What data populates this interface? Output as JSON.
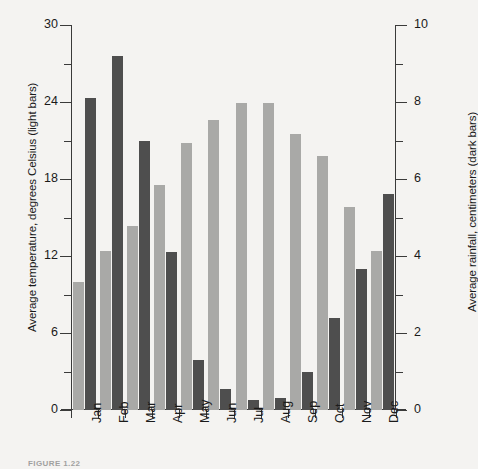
{
  "chart_data": {
    "type": "bar",
    "title": "",
    "subtitle": "",
    "categories": [
      "Jan",
      "Feb",
      "Mar",
      "Apr",
      "May",
      "Jun",
      "Jul",
      "Aug",
      "Sep",
      "Oct",
      "Nov",
      "Dec"
    ],
    "series": [
      {
        "name": "Average temperature",
        "unit": "degrees Celsius",
        "axis": "left",
        "color": "#a9a9a7",
        "style": "light bars",
        "values": [
          10.0,
          12.4,
          14.3,
          17.5,
          20.8,
          22.6,
          23.9,
          23.9,
          21.5,
          19.8,
          15.8,
          12.4
        ]
      },
      {
        "name": "Average rainfall",
        "unit": "centimeters",
        "axis": "right",
        "color": "#4e4e4e",
        "style": "dark bars",
        "values": [
          8.1,
          9.2,
          7.0,
          4.1,
          1.3,
          0.55,
          0.25,
          0.3,
          1.0,
          2.4,
          3.65,
          5.6
        ]
      }
    ],
    "xlabel": "",
    "ylabel_left": "Average temperature, degrees Celsius (light bars)",
    "ylabel_right": "Average rainfall, centimeters (dark bars)",
    "ylim_left": [
      0,
      30
    ],
    "ylim_right": [
      0,
      10
    ],
    "yticks_left": [
      0,
      6,
      12,
      18,
      24,
      30
    ],
    "yticks_left_minor": [
      3,
      9,
      15,
      21,
      27
    ],
    "yticks_right": [
      0,
      2,
      4,
      6,
      8,
      10
    ],
    "yticks_right_minor": [
      1,
      3,
      5,
      7,
      9
    ],
    "grid": false,
    "legend": "none (encoded in axis titles)"
  },
  "axes": {
    "left_title": "Average temperature, degrees Celsius (light bars)",
    "right_title": "Average rainfall, centimeters (dark bars)",
    "left_ticklabels": [
      "30",
      "24",
      "18",
      "12",
      "6",
      "0"
    ],
    "right_ticklabels": [
      "10",
      "8",
      "6",
      "4",
      "2",
      "0"
    ]
  },
  "caption": {
    "text": "FIGURE 1.22"
  }
}
